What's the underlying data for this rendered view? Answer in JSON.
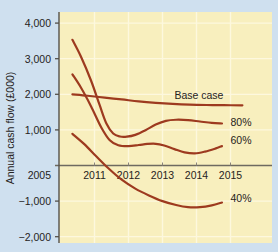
{
  "chart_data": {
    "type": "line",
    "title": "",
    "xlabel": "",
    "ylabel": "Annual cash flow (£000)",
    "grid": true,
    "legend_position": "right-inline",
    "ylim": [
      -2000,
      4500
    ],
    "xlim": [
      2005,
      2015.6
    ],
    "ytick_labels": [
      "4,000",
      "3,000",
      "2,000",
      "1,000",
      "−1,000",
      "−2,000"
    ],
    "ytick_values": [
      4000,
      3000,
      2000,
      1000,
      -1000,
      -2000
    ],
    "xtick_labels": [
      "2005",
      "2011",
      "2012",
      "2013",
      "2014",
      "2015"
    ],
    "xtick_values": [
      2005,
      2011,
      2012,
      2013,
      2014,
      2015
    ],
    "zero_line": 0,
    "colors": {
      "line": "#9d3a1f",
      "plot_background": "#f8efbe",
      "page_background": "#cfe0ef",
      "axis": "#6e6a60",
      "gridline": "#fdf8de",
      "text": "#262321"
    },
    "series": [
      {
        "name": "Base case",
        "label": "Base case",
        "label_x": 2013.35,
        "label_y": 1870,
        "points": [
          [
            2010.35,
            2000
          ],
          [
            2010.8,
            1960
          ],
          [
            2011.3,
            1905
          ],
          [
            2011.8,
            1855
          ],
          [
            2012.3,
            1800
          ],
          [
            2012.8,
            1760
          ],
          [
            2013.3,
            1730
          ],
          [
            2013.8,
            1710
          ],
          [
            2014.3,
            1700
          ],
          [
            2014.8,
            1695
          ],
          [
            2015.35,
            1690
          ]
        ]
      },
      {
        "name": "80%",
        "label": "80%",
        "label_x": 2015.0,
        "label_y": 1120,
        "points": [
          [
            2010.35,
            3530
          ],
          [
            2010.6,
            3060
          ],
          [
            2010.9,
            2380
          ],
          [
            2011.15,
            1700
          ],
          [
            2011.35,
            1180
          ],
          [
            2011.55,
            900
          ],
          [
            2011.75,
            815
          ],
          [
            2011.95,
            810
          ],
          [
            2012.2,
            860
          ],
          [
            2012.5,
            990
          ],
          [
            2012.8,
            1150
          ],
          [
            2013.1,
            1255
          ],
          [
            2013.4,
            1285
          ],
          [
            2013.75,
            1275
          ],
          [
            2014.1,
            1235
          ],
          [
            2014.45,
            1195
          ],
          [
            2014.75,
            1180
          ]
        ]
      },
      {
        "name": "60%",
        "label": "60%",
        "label_x": 2015.0,
        "label_y": 590,
        "points": [
          [
            2010.35,
            2560
          ],
          [
            2010.6,
            2190
          ],
          [
            2010.9,
            1660
          ],
          [
            2011.2,
            1070
          ],
          [
            2011.45,
            710
          ],
          [
            2011.7,
            570
          ],
          [
            2012.0,
            545
          ],
          [
            2012.3,
            575
          ],
          [
            2012.55,
            605
          ],
          [
            2012.8,
            610
          ],
          [
            2013.05,
            560
          ],
          [
            2013.35,
            460
          ],
          [
            2013.65,
            370
          ],
          [
            2013.95,
            340
          ],
          [
            2014.25,
            390
          ],
          [
            2014.55,
            475
          ],
          [
            2014.75,
            545
          ]
        ]
      },
      {
        "name": "40%",
        "label": "40%",
        "label_x": 2015.0,
        "label_y": -1035,
        "points": [
          [
            2010.35,
            890
          ],
          [
            2010.7,
            600
          ],
          [
            2011.05,
            260
          ],
          [
            2011.4,
            -70
          ],
          [
            2011.8,
            -400
          ],
          [
            2012.2,
            -650
          ],
          [
            2012.6,
            -840
          ],
          [
            2013.0,
            -1000
          ],
          [
            2013.4,
            -1110
          ],
          [
            2013.75,
            -1170
          ],
          [
            2014.1,
            -1170
          ],
          [
            2014.45,
            -1120
          ],
          [
            2014.75,
            -1040
          ]
        ]
      }
    ]
  }
}
